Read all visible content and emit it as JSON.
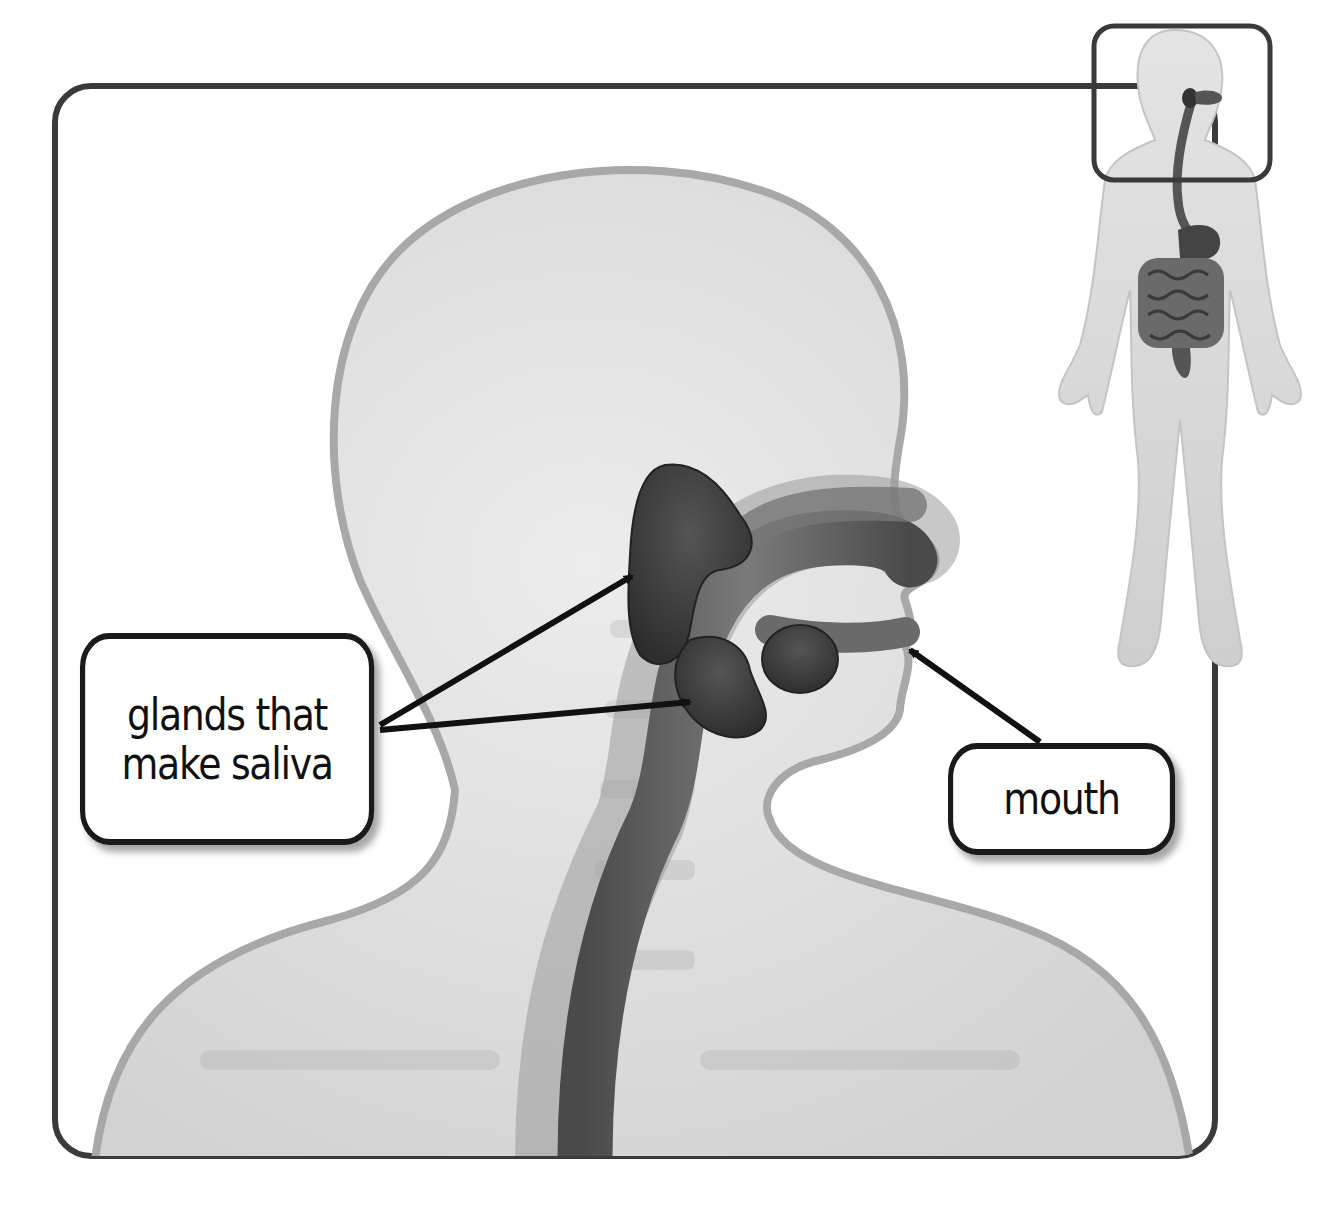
{
  "diagram": {
    "type": "anatomy-illustration",
    "labels": [
      {
        "id": "glands",
        "text": "glands that\nmake saliva",
        "points_to": [
          "parotid gland (upper)",
          "submandibular gland (lower)"
        ]
      },
      {
        "id": "mouth",
        "text": "mouth",
        "points_to": [
          "mouth opening"
        ]
      }
    ],
    "inset": {
      "description": "full body figure showing digestive tract; head region outlined with a rounded rectangle"
    },
    "colors": {
      "frame": "#3a3a3a",
      "body_fill": "#d9d9d9",
      "body_outline": "#a8a8a8",
      "organ_dark": "#3b3b3b",
      "tract_mid": "#6e6e6e",
      "arrow": "#111111",
      "background": "#ffffff"
    }
  }
}
